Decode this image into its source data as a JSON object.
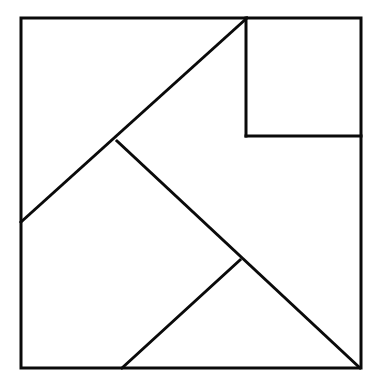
{
  "figure": {
    "name": "tangram-puzzle",
    "title": "Tangram dissection square",
    "background_color": "#ffffff",
    "line_color": "#0a0a0a",
    "line_width": 3,
    "canvas": {
      "width": 380,
      "height": 389
    },
    "outer_square": {
      "name": "outer-square",
      "left": 21,
      "top": 18,
      "right": 361,
      "bottom": 368,
      "width": 340,
      "height": 350,
      "points": "21,18 361,18 361,368 21,368"
    },
    "pieces": [
      {
        "id": "large-triangle-left",
        "label": "Large triangle (upper left)",
        "shape": "triangle",
        "points": "21,18 247,18 21,222"
      },
      {
        "id": "large-triangle-bottom",
        "label": "Large triangle (lower left)",
        "shape": "triangle",
        "points": "21,222 117,141 240,260 122,368 21,368"
      },
      {
        "id": "medium-triangle",
        "label": "Medium triangle (bottom center)",
        "shape": "triangle",
        "points": "122,368 240,260 360,368"
      },
      {
        "id": "small-square",
        "label": "Small square (top right)",
        "shape": "square",
        "points": "246,18 361,18 361,136 246,136"
      },
      {
        "id": "right-region",
        "label": "Right region below small square",
        "shape": "polygon",
        "points": "246,136 361,136 361,368 240,260"
      }
    ],
    "segments": [
      {
        "id": "outer-top",
        "label": "Outer square top edge",
        "x1": 21,
        "y1": 18,
        "x2": 361,
        "y2": 18
      },
      {
        "id": "outer-right",
        "label": "Outer square right edge",
        "x1": 361,
        "y1": 18,
        "x2": 361,
        "y2": 368
      },
      {
        "id": "outer-bottom",
        "label": "Outer square bottom edge",
        "x1": 361,
        "y1": 368,
        "x2": 21,
        "y2": 368
      },
      {
        "id": "outer-left",
        "label": "Outer square left edge",
        "x1": 21,
        "y1": 368,
        "x2": 21,
        "y2": 18
      },
      {
        "id": "diagonal-main",
        "label": "Long diagonal from left edge to top edge",
        "x1": 21,
        "y1": 222,
        "x2": 247,
        "y2": 18
      },
      {
        "id": "diagonal-second",
        "label": "Diagonal from mid vertex to bottom right corner",
        "x1": 117,
        "y1": 141,
        "x2": 360,
        "y2": 368
      },
      {
        "id": "diagonal-third",
        "label": "Diagonal from bottom edge to lower vertex",
        "x1": 122,
        "y1": 368,
        "x2": 240,
        "y2": 260
      },
      {
        "id": "square-left-edge",
        "label": "Small square left edge",
        "x1": 246,
        "y1": 18,
        "x2": 246,
        "y2": 136
      },
      {
        "id": "square-bottom-edge",
        "label": "Small square bottom edge",
        "x1": 246,
        "y1": 136,
        "x2": 361,
        "y2": 136
      }
    ],
    "vertices": [
      {
        "id": "vertex-top-left",
        "label": "Top left corner",
        "x": 21,
        "y": 18
      },
      {
        "id": "vertex-top-right",
        "label": "Top right corner",
        "x": 361,
        "y": 18
      },
      {
        "id": "vertex-bottom-right",
        "label": "Bottom right corner",
        "x": 361,
        "y": 368
      },
      {
        "id": "vertex-bottom-left",
        "label": "Bottom left corner",
        "x": 21,
        "y": 368
      },
      {
        "id": "vertex-left-diagonal",
        "label": "Diagonal meets left edge",
        "x": 21,
        "y": 222
      },
      {
        "id": "vertex-center-upper",
        "label": "Upper center junction",
        "x": 117,
        "y": 141
      },
      {
        "id": "vertex-top-diagonal",
        "label": "Diagonal meets top edge",
        "x": 247,
        "y": 18
      },
      {
        "id": "vertex-center-lower",
        "label": "Lower center junction",
        "x": 240,
        "y": 260
      },
      {
        "id": "vertex-bottom-diagonal",
        "label": "Diagonal meets bottom edge",
        "x": 122,
        "y": 368
      },
      {
        "id": "vertex-square-bl",
        "label": "Small square bottom left",
        "x": 246,
        "y": 136
      },
      {
        "id": "vertex-square-br",
        "label": "Small square bottom right",
        "x": 361,
        "y": 136
      }
    ]
  }
}
